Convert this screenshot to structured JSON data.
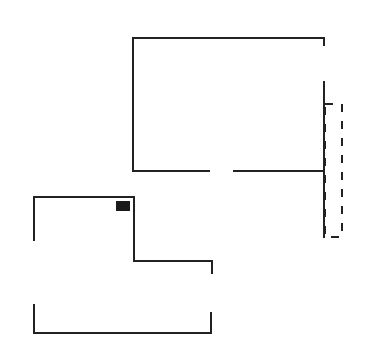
{
  "canvas": {
    "width": 365,
    "height": 347,
    "background": "#ffffff"
  },
  "colors": {
    "stroke": "#222222",
    "fill_block": "#1a1a1a"
  },
  "stroke_width": 2,
  "shapes": {
    "upper_room": {
      "paths": [
        "M324,45 L324,38 L133,38 L133,171 L209,171",
        "M234,171 L324,171",
        "M324,82 L324,237"
      ],
      "door_gap": {
        "x1": 209,
        "x2": 234,
        "y": 171
      }
    },
    "dashed_rect": {
      "x": 325,
      "y": 104,
      "width": 17,
      "height": 133,
      "dash": "8,9"
    },
    "lower_room": {
      "paths": [
        "M34,240 L34,197 L134,197 L134,261 L212,261 L212,273",
        "M34,305 L34,333 L211,333 L211,313"
      ],
      "block": {
        "x": 116,
        "y": 201,
        "width": 14,
        "height": 10
      }
    }
  }
}
